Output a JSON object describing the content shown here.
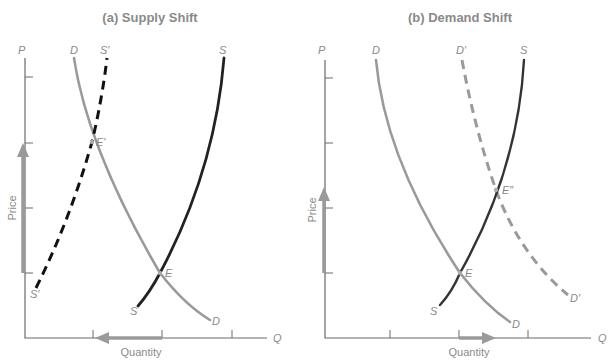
{
  "panels": [
    {
      "id": "a",
      "title": "(a) Supply Shift",
      "y_axis_symbol": "P",
      "x_axis_symbol": "Q",
      "y_axis_label": "Price",
      "x_axis_label": "Quantity",
      "curves": {
        "D_top": "D",
        "D_bottom": "D",
        "S_top": "S",
        "S_bottom": "S",
        "S2_top": "S′",
        "S2_bottom": "S′"
      },
      "equilibria": {
        "original": "E",
        "new": "E′"
      },
      "price_arrow": "up",
      "quantity_arrow": "left"
    },
    {
      "id": "b",
      "title": "(b) Demand Shift",
      "y_axis_symbol": "P",
      "x_axis_symbol": "Q",
      "y_axis_label": "Price",
      "x_axis_label": "Quantity",
      "curves": {
        "D_top": "D",
        "D_bottom": "D",
        "S_top": "S",
        "S_bottom": "S",
        "D2_top": "D′",
        "D2_bottom": "D′"
      },
      "equilibria": {
        "original": "E",
        "new": "E″"
      },
      "price_arrow": "up",
      "quantity_arrow": "right"
    }
  ],
  "colors": {
    "demand": "#9a9a9a",
    "supply": "#222222",
    "text": "#8a8a8a",
    "axis": "#6a6a6a"
  }
}
